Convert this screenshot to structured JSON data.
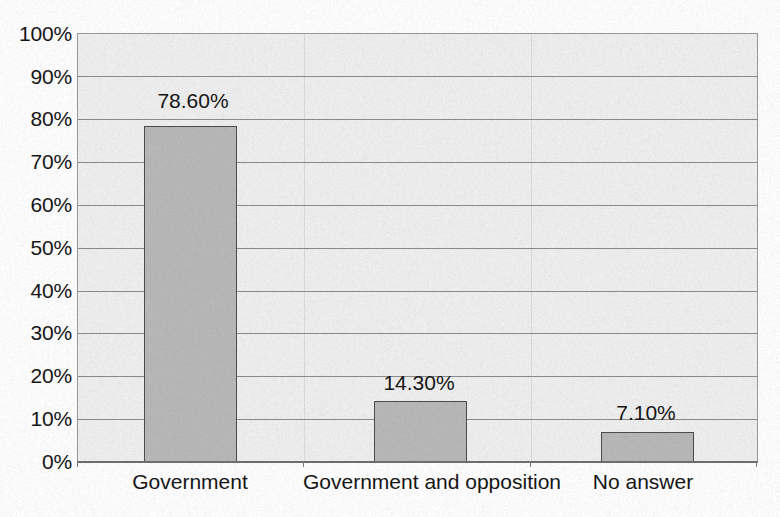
{
  "chart_data": {
    "type": "bar",
    "title": "",
    "subtitle": "",
    "xlabel": "",
    "ylabel": "",
    "categories": [
      "Government",
      "Government and opposition",
      "No answer"
    ],
    "values": [
      78.6,
      14.3,
      7.1
    ],
    "value_labels": [
      "78.60%",
      "14.30%",
      "7.10%"
    ],
    "ylim": [
      0,
      100
    ],
    "ytick_labels": [
      "100%",
      "90%",
      "80%",
      "70%",
      "60%",
      "50%",
      "40%",
      "30%",
      "20%",
      "10%",
      "0%"
    ],
    "ytick_values": [
      100,
      90,
      80,
      70,
      60,
      50,
      40,
      30,
      20,
      10,
      0
    ],
    "ytick_step": 10,
    "grid": true,
    "grid_axis": "y",
    "legend": false,
    "legend_position": "none",
    "series": [
      {
        "name": "",
        "values": [
          78.6,
          14.3,
          7.1
        ]
      }
    ],
    "colors": {
      "bar_fill": "#b9b9b9",
      "bar_border": "#4d4d4d",
      "plot_background": "#f0f0f0",
      "gridline": "#8c8c8c",
      "axis_line": "#6f6f6f",
      "text": "#161616",
      "page_background": "#ffffff"
    }
  }
}
